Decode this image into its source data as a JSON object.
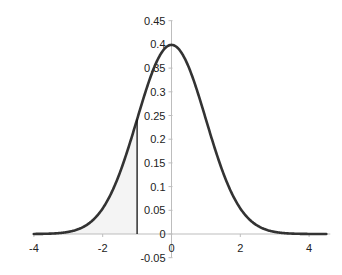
{
  "chart_data": {
    "type": "line",
    "title": "",
    "xlabel": "",
    "ylabel": "",
    "xlim": [
      -4,
      4.5
    ],
    "ylim": [
      -0.05,
      0.45
    ],
    "grid": false,
    "legend": null,
    "x_ticks": [
      -4,
      -2,
      0,
      2,
      4
    ],
    "x_tick_labels": [
      "-4",
      "-2",
      "0",
      "2",
      "4"
    ],
    "y_ticks": [
      -0.05,
      0,
      0.05,
      0.1,
      0.15,
      0.2,
      0.25,
      0.3,
      0.35,
      0.4,
      0.45
    ],
    "y_tick_labels": [
      "-0.05",
      "0",
      "0.05",
      "0.1",
      "0.15",
      "0.2",
      "0.25",
      "0.3",
      "0.35",
      "0.4",
      "0.45"
    ],
    "series": [
      {
        "name": "Normal PDF (mean 0, sd 1)",
        "color": "#333333",
        "x": [
          -4,
          -3.5,
          -3,
          -2.5,
          -2,
          -1.5,
          -1,
          -0.5,
          0,
          0.5,
          1,
          1.5,
          2,
          2.5,
          3,
          3.5,
          4,
          4.5
        ],
        "values": [
          0.0001,
          0.0009,
          0.0044,
          0.0175,
          0.054,
          0.1295,
          0.242,
          0.3521,
          0.3989,
          0.3521,
          0.242,
          0.1295,
          0.054,
          0.0175,
          0.0044,
          0.0009,
          0.0001,
          0.0
        ]
      }
    ],
    "annotations": [
      {
        "type": "vertical-line",
        "x": -1,
        "y_from": 0,
        "y_to": 0.242,
        "color": "#111111"
      },
      {
        "type": "shaded-area",
        "x_from": -4,
        "x_to": -1,
        "under": "Normal PDF (mean 0, sd 1)",
        "color": "#f4f4f4"
      }
    ]
  }
}
